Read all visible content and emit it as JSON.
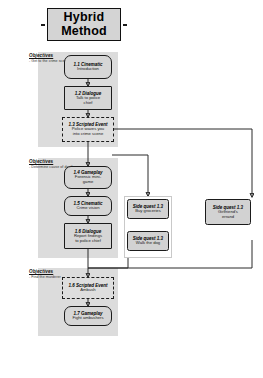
{
  "title": {
    "line1": "Hybrid",
    "line2": "Method"
  },
  "objectives": [
    {
      "heading": "Objectives",
      "sub": "- Get to the crime scene"
    },
    {
      "heading": "Objectives",
      "sub": "- Determine cause of death"
    },
    {
      "heading": "Objectives",
      "sub": "- Find the murderer"
    }
  ],
  "main_nodes": [
    {
      "id": "1.1",
      "title": "1.1 Cinematic",
      "body": "Introduction",
      "shape": "pill"
    },
    {
      "id": "1.2",
      "title": "1.2 Dialogue",
      "body": "Talk to police\nchief",
      "shape": "rect"
    },
    {
      "id": "1.3",
      "title": "1.3 Scripted Event",
      "body": "Police waves you\ninto crime scene",
      "shape": "dashed"
    },
    {
      "id": "1.4",
      "title": "1.4 Gameplay",
      "body": "Forensic mini-\ngame",
      "shape": "pill"
    },
    {
      "id": "1.5",
      "title": "1.5 Cinematic",
      "body": "Crime vision",
      "shape": "pill"
    },
    {
      "id": "1.6",
      "title": "1.6 Dialogue",
      "body": "Report findings\nto police chief",
      "shape": "rect"
    },
    {
      "id": "1.6b",
      "title": "1.6 Scripted Event",
      "body": "Ambush",
      "shape": "dashed"
    },
    {
      "id": "1.7",
      "title": "1.7 Gameplay",
      "body": "Fight ambushers",
      "shape": "pill"
    }
  ],
  "side_quests": [
    {
      "title": "Side quest 1.3",
      "body": "Buy groceries"
    },
    {
      "title": "Side quest 1.3",
      "body": "Walk the dog"
    },
    {
      "title": "Side quest 1.3",
      "body": "Girlfriend's\nerrand"
    }
  ],
  "colors": {
    "node_fill": "#d6d6d6",
    "lane_fill": "#dcdcdc",
    "banner_fill": "#d4d4d4",
    "stroke": "#1b1b1b",
    "page": "#ffffff"
  }
}
